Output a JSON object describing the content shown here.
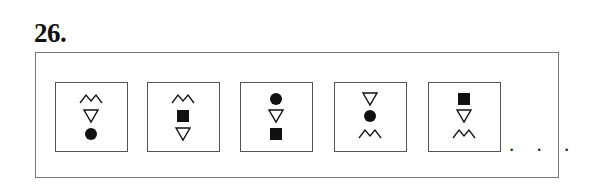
{
  "question": {
    "number_label": "26."
  },
  "sequence": {
    "cells": [
      {
        "symbols": [
          "zigzag",
          "triangle-down",
          "circle"
        ]
      },
      {
        "symbols": [
          "zigzag",
          "square",
          "triangle-down"
        ]
      },
      {
        "symbols": [
          "circle",
          "triangle-down",
          "square"
        ]
      },
      {
        "symbols": [
          "triangle-down",
          "circle",
          "zigzag"
        ]
      },
      {
        "symbols": [
          "square",
          "triangle-down",
          "zigzag"
        ]
      }
    ],
    "continuation": "· · ·"
  },
  "colors": {
    "ink": "#111111",
    "border": "#555555",
    "frame": "#777777",
    "background": "#ffffff"
  }
}
